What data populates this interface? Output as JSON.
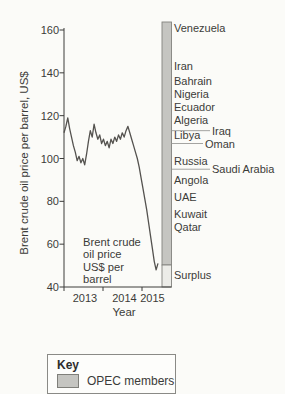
{
  "colors": {
    "background": "#fbfbf8",
    "text": "#3b3b39",
    "axis": "#3c3c3a",
    "price_line": "#54524f",
    "opec_fill": "#c5c5c1",
    "opec_stroke": "#83837e",
    "surplus_fill": "#ececе8",
    "leader_line": "#9a9a96"
  },
  "y_axis": {
    "title": "Brent crude oil price per barrel, US$",
    "ticks": [
      "160",
      "140",
      "120",
      "100",
      "80",
      "60",
      "40"
    ]
  },
  "x_axis": {
    "title": "Year",
    "ticks": [
      "2013",
      "2014",
      "2015"
    ]
  },
  "annotation": "Brent crude\noil price\nUS$ per\nbarrel",
  "opec_bar": {
    "countries": [
      {
        "name": "Venezuela",
        "value": 161
      },
      {
        "name": "Iran",
        "value": 143
      },
      {
        "name": "Bahrain",
        "value": 136
      },
      {
        "name": "Nigeria",
        "value": 130
      },
      {
        "name": "Ecuador",
        "value": 124
      },
      {
        "name": "Algeria",
        "value": 118
      },
      {
        "name": "Iraq",
        "value": 113
      },
      {
        "name": "Libya",
        "value": 111
      },
      {
        "name": "Oman",
        "value": 107
      },
      {
        "name": "Russia",
        "value": 99
      },
      {
        "name": "Saudi Arabia",
        "value": 95
      },
      {
        "name": "Angola",
        "value": 90
      },
      {
        "name": "UAE",
        "value": 82
      },
      {
        "name": "Kuwait",
        "value": 74
      },
      {
        "name": "Qatar",
        "value": 68
      }
    ],
    "surplus": {
      "name": "Surplus",
      "value": 45.5
    }
  },
  "key": {
    "title": "Key",
    "item": "OPEC members"
  },
  "chart_data": {
    "type": "line",
    "xlabel": "Year",
    "ylabel": "Brent crude oil price per barrel, US$",
    "ylim": [
      40,
      160
    ],
    "x_range": [
      "2013-01",
      "2015-02"
    ],
    "x_tick_labels": [
      "2013",
      "2014",
      "2015"
    ],
    "series": [
      {
        "name": "Brent crude oil price",
        "values": [
          112,
          115,
          119,
          114,
          110,
          106,
          103,
          99,
          101,
          98,
          100,
          97,
          102,
          108,
          113,
          110,
          116,
          112,
          109,
          111,
          107,
          109,
          106,
          108,
          105,
          109,
          107,
          110,
          108,
          111,
          109,
          112,
          110,
          113,
          115,
          112,
          109,
          106,
          103,
          100,
          96,
          91,
          86,
          81,
          76,
          70,
          64,
          58,
          52,
          48,
          51
        ]
      }
    ],
    "monthly_values": {
      "2013": [
        112,
        118,
        109,
        102,
        103,
        101,
        107,
        111,
        112,
        109,
        108,
        111
      ],
      "2014": [
        107,
        109,
        107,
        108,
        110,
        112,
        107,
        101,
        97,
        87,
        79,
        62
      ],
      "2015": [
        48,
        51
      ]
    },
    "opec_breakeven_bar": {
      "legend": "OPEC members",
      "labels": [
        {
          "country": "Venezuela",
          "approx_price": 161
        },
        {
          "country": "Iran",
          "approx_price": 143
        },
        {
          "country": "Bahrain",
          "approx_price": 136
        },
        {
          "country": "Nigeria",
          "approx_price": 130
        },
        {
          "country": "Ecuador",
          "approx_price": 124
        },
        {
          "country": "Algeria",
          "approx_price": 118
        },
        {
          "country": "Iraq",
          "approx_price": 113
        },
        {
          "country": "Libya",
          "approx_price": 111
        },
        {
          "country": "Oman",
          "approx_price": 107
        },
        {
          "country": "Russia",
          "approx_price": 99
        },
        {
          "country": "Saudi Arabia",
          "approx_price": 95
        },
        {
          "country": "Angola",
          "approx_price": 90
        },
        {
          "country": "UAE",
          "approx_price": 82
        },
        {
          "country": "Kuwait",
          "approx_price": 74
        },
        {
          "country": "Qatar",
          "approx_price": 68
        },
        {
          "country": "Surplus",
          "approx_price": 45.5
        }
      ]
    }
  }
}
